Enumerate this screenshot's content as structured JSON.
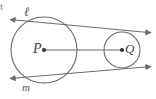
{
  "figure": {
    "type": "geometry-diagram",
    "background_color": "#ffffff",
    "stroke_color": "#6b6b6b",
    "text_color": "#4a4a4a",
    "labels": {
      "tangent_line_top": "ℓ",
      "tangent_line_bottom": "m",
      "center_left": "P",
      "center_right": "Q",
      "stray_text": "t"
    },
    "circles": [
      {
        "name": "circle-P",
        "center_label": "P",
        "cx": 44,
        "cy": 50,
        "r": 33
      },
      {
        "name": "circle-Q",
        "center_label": "Q",
        "cx": 122,
        "cy": 50,
        "r": 18
      }
    ],
    "center_segment": {
      "from": "P",
      "to": "Q",
      "x1": 44,
      "y1": 50,
      "x2": 122,
      "y2": 50
    },
    "tangents": [
      {
        "name": "tangent-line-l",
        "label": "ℓ",
        "x1": 9,
        "y1": 19,
        "x2": 152,
        "y2": 33,
        "arrow_start": true,
        "arrow_end": true
      },
      {
        "name": "tangent-line-m",
        "label": "m",
        "x1": 9,
        "y1": 79,
        "x2": 152,
        "y2": 67,
        "arrow_start": true,
        "arrow_end": true
      }
    ]
  }
}
